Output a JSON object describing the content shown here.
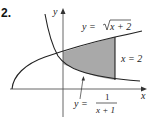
{
  "problem": {
    "number": "2."
  },
  "axes": {
    "x_label": "x",
    "y_label": "y"
  },
  "curves": {
    "upper": {
      "label_prefix": "y = ",
      "label_expr": "x + 2",
      "label_full": "y = √(x + 2)"
    },
    "lower": {
      "label_prefix": "y = ",
      "numerator": "1",
      "denominator": "x + 1",
      "label_full": "y = 1/(x + 1)"
    },
    "vertical": {
      "label": "x = 2"
    }
  },
  "region": {
    "fill": "#a9a9a9",
    "description": "Area bounded by y = √(x+2), y = 1/(x+1), x = 0 and x = 2"
  },
  "colors": {
    "stroke": "#222222",
    "axis": "#555555",
    "shade": "#a9a9a9"
  }
}
